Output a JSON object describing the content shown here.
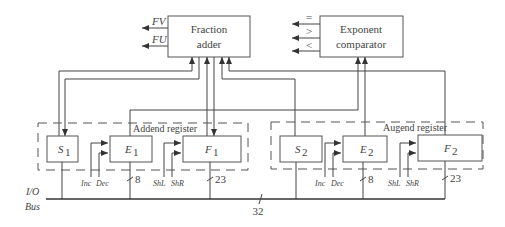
{
  "diagram": {
    "title": "",
    "blocks": {
      "fraction_adder": {
        "line1": "Fraction",
        "line2": "adder"
      },
      "exponent_comparator": {
        "line1": "Exponent",
        "line2": "comparator"
      }
    },
    "fraction_adder_outputs": [
      "FV",
      "FU"
    ],
    "comparator_outputs": [
      "=",
      ">",
      "<"
    ],
    "groups": {
      "addend": {
        "label": "Addend register"
      },
      "augend": {
        "label": "Augend register"
      }
    },
    "registers": {
      "s1": {
        "name": "S",
        "sub": "1"
      },
      "e1": {
        "name": "E",
        "sub": "1"
      },
      "f1": {
        "name": "F",
        "sub": "1"
      },
      "s2": {
        "name": "S",
        "sub": "2"
      },
      "e2": {
        "name": "E",
        "sub": "2"
      },
      "f2": {
        "name": "F",
        "sub": "2"
      }
    },
    "controls": {
      "inc": "Inc",
      "dec": "Dec",
      "shl": "ShL",
      "shr": "ShR"
    },
    "widths": {
      "exponent": "8",
      "fraction": "23",
      "bus": "32"
    },
    "bus": {
      "line1": "I/O",
      "line2": "Bus"
    }
  }
}
